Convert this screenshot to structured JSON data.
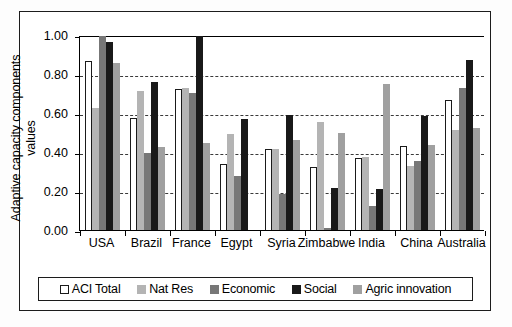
{
  "chart_data": {
    "type": "bar",
    "title": "",
    "xlabel": "",
    "ylabel": "Adaptive capacity components values",
    "ylabel_line1": "Adaptive capacity components",
    "ylabel_line2": "values",
    "ylim": [
      0.0,
      1.0
    ],
    "ytick_labels": [
      "1.00",
      "0.80",
      "0.60",
      "0.40",
      "0.20",
      "0.00"
    ],
    "ytick_values": [
      1.0,
      0.8,
      0.6,
      0.4,
      0.2,
      0.0
    ],
    "grid": "horizontal-dashed",
    "legend_position": "bottom",
    "categories": [
      "USA",
      "Brazil",
      "France",
      "Egypt",
      "Syria",
      "Zimbabwe",
      "India",
      "China",
      "Australia"
    ],
    "series": [
      {
        "name": "ACI Total",
        "color": "#ffffff",
        "values": [
          0.87,
          0.58,
          0.73,
          0.345,
          0.42,
          0.33,
          0.375,
          0.435,
          0.67
        ]
      },
      {
        "name": "Nat Res",
        "color": "#b4b4b4",
        "values": [
          0.63,
          0.72,
          0.735,
          0.5,
          0.42,
          0.56,
          0.38,
          0.335,
          0.52
        ]
      },
      {
        "name": "Economic",
        "color": "#777777",
        "values": [
          1.0,
          0.4,
          0.71,
          0.28,
          0.19,
          0.015,
          0.13,
          0.36,
          0.735
        ]
      },
      {
        "name": "Social",
        "color": "#191919",
        "values": [
          0.97,
          0.765,
          1.0,
          0.575,
          0.595,
          0.22,
          0.215,
          0.59,
          0.875
        ]
      },
      {
        "name": "Agric innovation",
        "color": "#a0a0a0",
        "values": [
          0.86,
          0.43,
          0.45,
          0.0,
          0.465,
          0.505,
          0.755,
          0.44,
          0.53
        ]
      }
    ]
  },
  "legend": {
    "items": [
      {
        "label": "ACI Total",
        "key": "aci"
      },
      {
        "label": "Nat Res",
        "key": "natres"
      },
      {
        "label": "Economic",
        "key": "economic"
      },
      {
        "label": "Social",
        "key": "social"
      },
      {
        "label": "Agric innovation",
        "key": "agric"
      }
    ]
  }
}
